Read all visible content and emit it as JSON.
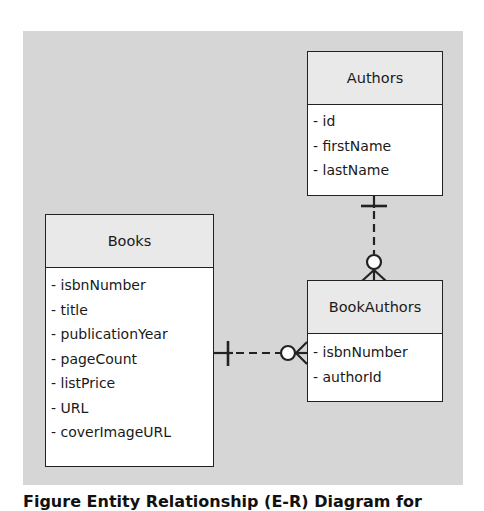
{
  "diagram": {
    "type": "entity-relationship",
    "entities": [
      {
        "name": "Authors",
        "attributes": [
          "- id",
          "- firstName",
          "- lastName"
        ]
      },
      {
        "name": "Books",
        "attributes": [
          "- isbnNumber",
          "- title",
          "- publicationYear",
          "- pageCount",
          "- listPrice",
          "- URL",
          "- coverImageURL"
        ]
      },
      {
        "name": "BookAuthors",
        "attributes": [
          "- isbnNumber",
          "- authorId"
        ]
      }
    ],
    "relationships": [
      {
        "from": "Authors",
        "to": "BookAuthors",
        "from_cardinality": "one (mandatory)",
        "to_cardinality": "zero-or-many",
        "style": "dashed"
      },
      {
        "from": "Books",
        "to": "BookAuthors",
        "from_cardinality": "one (mandatory)",
        "to_cardinality": "zero-or-many",
        "style": "dashed"
      }
    ],
    "colors": {
      "background": "#d6d6d6",
      "header": "#e9e9e9",
      "body": "#ffffff",
      "line": "#222222"
    }
  },
  "caption": "Figure      Entity Relationship (E-R) Diagram for"
}
